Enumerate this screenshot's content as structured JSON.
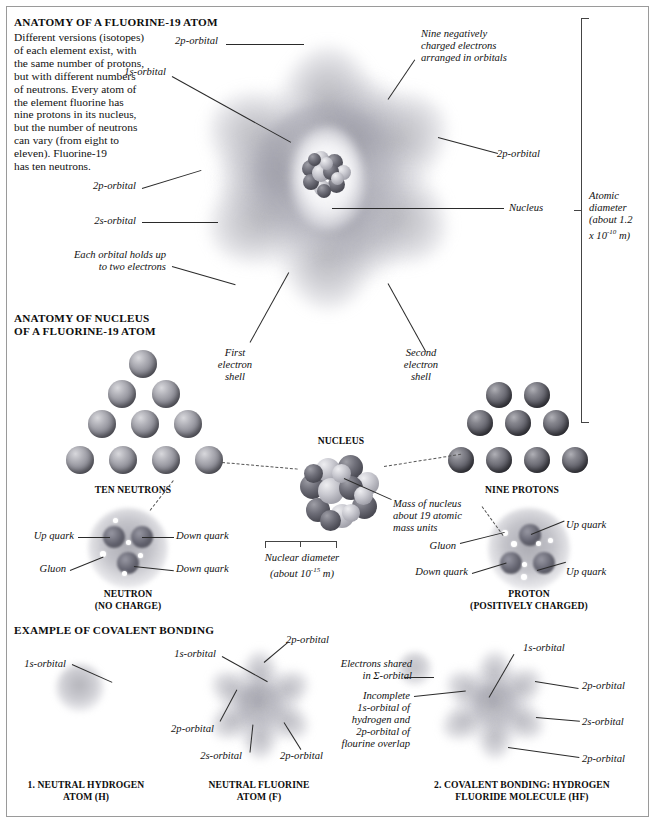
{
  "sections": {
    "atom": {
      "title": "ANATOMY OF A FLUORINE-19 ATOM",
      "intro": "Different versions (isotopes)\nof each element exist, with\nthe same number of protons,\nbut with different numbers\nof neutrons. Every atom of\nthe element fluorine has\nnine protons in its nucleus,\nbut the number of neutrons\ncan vary (from eight to\neleven). Fluorine-19\nhas ten neutrons.",
      "labels": {
        "p_top": "2p-orbital",
        "s1": "1s-orbital",
        "electrons": "Nine negatively\ncharged electrons\narranged in orbitals",
        "p_right": "2p-orbital",
        "p_left": "2p-orbital",
        "s2": "2s-orbital",
        "nucleus": "Nucleus",
        "each_orbital": "Each orbital holds up\nto two electrons",
        "first_shell": "First\nelectron\nshell",
        "second_shell": "Second\nelectron\nshell",
        "atomic_diameter": "Atomic\ndiameter\n(about 1.2\nx 10",
        "atomic_diameter_exp": "-10",
        "atomic_diameter_unit": " m)"
      }
    },
    "nucleus": {
      "title": "ANATOMY OF NUCLEUS\nOF A FLUORINE-19 ATOM",
      "neutrons_caption": "TEN NEUTRONS",
      "protons_caption": "NINE PROTONS",
      "nucleus_caption": "NUCLEUS",
      "mass_label": "Mass of nucleus\nabout 19 atomic\nmass units",
      "nuclear_diameter": "Nuclear diameter\n(about 10",
      "nuclear_diameter_exp": "-15",
      "nuclear_diameter_unit": " m)",
      "neutron": {
        "caption": "NEUTRON\n(NO CHARGE)",
        "up_quark": "Up quark",
        "down_quark_1": "Down quark",
        "down_quark_2": "Down quark",
        "gluon": "Gluon"
      },
      "proton": {
        "caption": "PROTON\n(POSITIVELY CHARGED)",
        "up_quark_1": "Up quark",
        "up_quark_2": "Up quark",
        "down_quark": "Down quark",
        "gluon": "Gluon"
      },
      "neutron_count": 10,
      "proton_count": 9
    },
    "covalent": {
      "title": "EXAMPLE OF COVALENT BONDING",
      "hydrogen": {
        "caption": "1. NEUTRAL HYDROGEN\nATOM (H)",
        "s1": "1s-orbital"
      },
      "fluorine": {
        "caption": "NEUTRAL FLUORINE\nATOM (F)",
        "s1": "1s-orbital",
        "p_top": "2p-orbital",
        "p_left": "2p-orbital",
        "s2": "2s-orbital",
        "p_bottom": "2p-orbital"
      },
      "hf": {
        "caption": "2. COVALENT BONDING: HYDROGEN\nFLUORIDE MOLECULE (HF)",
        "shared": "Electrons shared\nin Σ-orbital",
        "incomplete": "Incomplete\n1s-orbital of\nhydrogen and\n2p-orbital of\nflourine overlap",
        "s1": "1s-orbital",
        "p_right": "2p-orbital",
        "s2": "2s-orbital",
        "p_bottom": "2p-orbital"
      }
    }
  },
  "colors": {
    "ink": "#111111",
    "rule": "#2a2a2a",
    "dash": "#555555",
    "frame": "#9a9a9a",
    "sphere_light": "#d8d8dc",
    "sphere_dark": "#3a3a42"
  }
}
